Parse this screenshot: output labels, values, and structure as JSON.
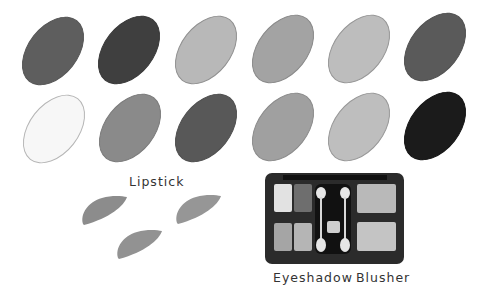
{
  "swatches": {
    "row1": [
      {
        "color": "#5e5e5e",
        "border": "#555555"
      },
      {
        "color": "#3f3f3f",
        "border": "#383838"
      },
      {
        "color": "#b8b8b8",
        "border": "#8f8f8f"
      },
      {
        "color": "#a3a3a3",
        "border": "#888888"
      },
      {
        "color": "#bdbdbd",
        "border": "#959595"
      },
      {
        "color": "#5a5a5a",
        "border": "#505050"
      }
    ],
    "row2": [
      {
        "color": "#f7f7f7",
        "border": "#b5b5b5"
      },
      {
        "color": "#8a8a8a",
        "border": "#7a7a7a"
      },
      {
        "color": "#585858",
        "border": "#4e4e4e"
      },
      {
        "color": "#a0a0a0",
        "border": "#8a8a8a"
      },
      {
        "color": "#bebebe",
        "border": "#979797"
      },
      {
        "color": "#1b1b1b",
        "border": "#141414"
      }
    ]
  },
  "labels": {
    "lipstick": "Lipstick",
    "eyeshadow": "Eyeshadow",
    "blusher": "Blusher"
  },
  "lipstick_colors": [
    "#8c8c8c",
    "#969696",
    "#929292"
  ],
  "palette": {
    "case_color": "#2b2b2b",
    "eyeshadow_pans": [
      "#e2e2e2",
      "#6e6e6e",
      "#a5a5a5",
      "#b5b5b5"
    ],
    "blusher_pans": [
      "#b9b9b9",
      "#c4c4c4"
    ]
  }
}
